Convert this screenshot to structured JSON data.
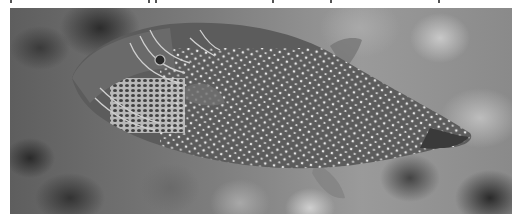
{
  "image": {
    "description": "Grayscale photograph of a spotted pufferfish (toby) swimming to the right over a blurred reef background",
    "subject": "pufferfish",
    "color_mode": "grayscale",
    "colors": {
      "background": "#ffffff",
      "fish_body": "#5a5a5a",
      "spots": "#e0e0e0",
      "reef_dark": "#2c2c2c",
      "reef_light": "#c8c8c8"
    }
  }
}
